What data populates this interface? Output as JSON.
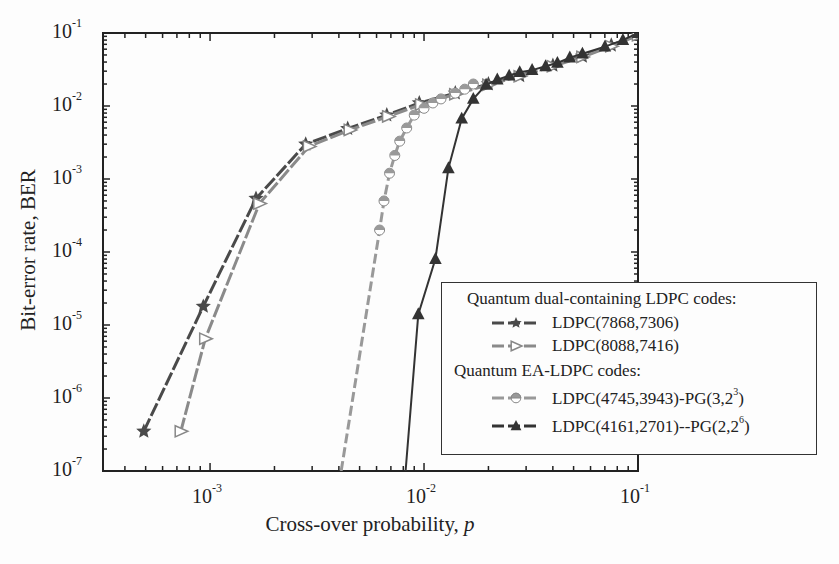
{
  "chart_data": {
    "type": "line",
    "xscale": "log",
    "yscale": "log",
    "xlabel": "Cross-over probability, ",
    "xlabel_var": "p",
    "ylabel": "Bit-error rate, BER",
    "xlim": [
      0.000316,
      0.1
    ],
    "ylim": [
      1e-07,
      0.1
    ],
    "x_ticks": [
      {
        "base": "10",
        "exp": "-3",
        "value": 0.001
      },
      {
        "base": "10",
        "exp": "-2",
        "value": 0.01
      },
      {
        "base": "10",
        "exp": "-1",
        "value": 0.1
      }
    ],
    "y_ticks": [
      {
        "base": "10",
        "exp": "-1",
        "value": 0.1
      },
      {
        "base": "10",
        "exp": "-2",
        "value": 0.01
      },
      {
        "base": "10",
        "exp": "-3",
        "value": 0.001
      },
      {
        "base": "10",
        "exp": "-4",
        "value": 0.0001
      },
      {
        "base": "10",
        "exp": "-5",
        "value": 1e-05
      },
      {
        "base": "10",
        "exp": "-6",
        "value": 1e-06
      },
      {
        "base": "10",
        "exp": "-7",
        "value": 1e-07
      }
    ],
    "grid": false,
    "legend_position": "lower right",
    "legend_groups": [
      {
        "title": "Quantum dual-containing LDPC codes:",
        "series_idx": [
          0,
          1
        ]
      },
      {
        "title": "Quantum EA-LDPC codes:",
        "series_idx": [
          2,
          3
        ]
      }
    ],
    "series": [
      {
        "name": "LDPC(7868,7306)",
        "marker": "star",
        "color": "#4a4a4a",
        "x": [
          0.00049,
          0.00093,
          0.00164,
          0.0028,
          0.0044,
          0.0067,
          0.0095,
          0.014,
          0.02,
          0.028,
          0.04,
          0.055,
          0.075,
          0.1
        ],
        "y": [
          3.5e-07,
          1.8e-05,
          0.00054,
          0.003,
          0.0049,
          0.0075,
          0.011,
          0.015,
          0.02,
          0.026,
          0.036,
          0.048,
          0.068,
          0.095
        ]
      },
      {
        "name": "LDPC(8088,7416)",
        "marker": "triangle-right",
        "color": "#8a8a8a",
        "x": [
          0.00073,
          0.00095,
          0.0017,
          0.0029,
          0.0045,
          0.0068,
          0.0097,
          0.014,
          0.02,
          0.028,
          0.04,
          0.055,
          0.075,
          0.1
        ],
        "y": [
          3.5e-07,
          6.5e-06,
          0.00046,
          0.0028,
          0.0047,
          0.0072,
          0.0105,
          0.0145,
          0.0195,
          0.0255,
          0.035,
          0.047,
          0.066,
          0.093
        ]
      },
      {
        "name": "LDPC(4745,3943)-PG(3,2",
        "name_sup": "3",
        "name_tail": ")",
        "marker": "half-circle",
        "color": "#999999",
        "x": [
          0.0041,
          0.0062,
          0.0065,
          0.0069,
          0.0073,
          0.0077,
          0.0083,
          0.009,
          0.01,
          0.011,
          0.012,
          0.014,
          0.0155,
          0.017
        ],
        "y": [
          1e-07,
          0.0002,
          0.0005,
          0.0012,
          0.0021,
          0.0033,
          0.005,
          0.0075,
          0.0093,
          0.011,
          0.0125,
          0.015,
          0.017,
          0.02
        ]
      },
      {
        "name": "LDPC(4161,2701)--PG(2,2",
        "name_sup": "6",
        "name_tail": ")",
        "marker": "triangle-up",
        "color": "#333333",
        "x": [
          0.0082,
          0.0094,
          0.0113,
          0.013,
          0.015,
          0.017,
          0.0195,
          0.022,
          0.025,
          0.028,
          0.032,
          0.037,
          0.042,
          0.048,
          0.055,
          0.07,
          0.085,
          0.1
        ],
        "y": [
          1e-07,
          1.4e-05,
          8e-05,
          0.0014,
          0.0067,
          0.0125,
          0.0195,
          0.023,
          0.026,
          0.029,
          0.031,
          0.035,
          0.039,
          0.046,
          0.052,
          0.065,
          0.08,
          0.1
        ]
      }
    ],
    "hidden_x_start": [
      true,
      true,
      true,
      true
    ]
  },
  "legend": {
    "group1_title": "Quantum dual-containing LDPC codes:",
    "group2_title": "Quantum EA-LDPC codes:",
    "item1": "LDPC(7868,7306)",
    "item2": "LDPC(8088,7416)",
    "item3_main": "LDPC(4745,3943)-PG(3,2",
    "item3_sup": "3",
    "item3_tail": ")",
    "item4_main": "LDPC(4161,2701)--PG(2,2",
    "item4_sup": "6",
    "item4_tail": ")"
  },
  "axis": {
    "ylabel": "Bit-error rate, BER",
    "xlabel": "Cross-over probability, ",
    "xlabel_var": "p"
  }
}
